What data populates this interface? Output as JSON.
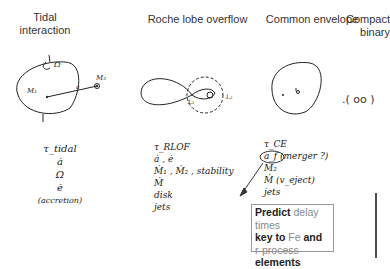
{
  "columns": [
    {
      "title_line1": "Tidal",
      "title_line2": "interaction",
      "params": [
        "τ_tidal",
        "ȧ",
        "Ω",
        "ė",
        "(accretion)"
      ],
      "labels": {
        "primary": "M₁",
        "secondary": "M₂",
        "separation": "a",
        "spin": "Ω"
      }
    },
    {
      "title_line1": "Roche lobe overflow",
      "params": [
        "τ_RLOF",
        "ȧ , ė",
        "Ṁ₁ , Ṁ₂ , stability",
        "Ṁ",
        "disk",
        "jets"
      ],
      "labels": {
        "l1": "L₁",
        "l2": "L₂"
      }
    },
    {
      "title_line1": "Common envelope",
      "params": [
        "τ_CE",
        "a_f",
        "(merger ?)",
        "M₂",
        "Ṁ (v_eject)",
        "jets"
      ]
    },
    {
      "title_line1": "Compact",
      "title_line2": "binary",
      "sketch": ".( oo )"
    }
  ],
  "callout": {
    "lines": [
      [
        {
          "t": "Predict ",
          "s": "b"
        },
        {
          "t": "delay times",
          "s": "g"
        }
      ],
      [
        {
          "t": "key to ",
          "s": "b"
        },
        {
          "t": "Fe",
          "s": "g"
        },
        {
          "t": " and",
          "s": "b"
        }
      ],
      [
        {
          "t": "r-process ",
          "s": "g"
        },
        {
          "t": "elements",
          "s": "b"
        }
      ],
      [
        {
          "t": "production",
          "s": "b"
        }
      ]
    ]
  }
}
